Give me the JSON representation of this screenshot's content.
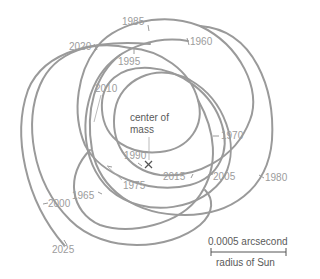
{
  "diagram": {
    "center_label_line1": "center of",
    "center_label_line2": "mass",
    "center_marker": "×",
    "scale": {
      "top_label": "0.0005 arcsecond",
      "bottom_label": "radius of Sun"
    },
    "years": [
      {
        "label": "1960",
        "x": 187,
        "y": 38
      },
      {
        "label": "1965",
        "x": 71,
        "y": 192
      },
      {
        "label": "1970",
        "x": 218,
        "y": 132
      },
      {
        "label": "1975",
        "x": 123,
        "y": 178
      },
      {
        "label": "1980",
        "x": 262,
        "y": 173
      },
      {
        "label": "1985",
        "x": 122,
        "y": 18
      },
      {
        "label": "1990",
        "x": 124,
        "y": 148
      },
      {
        "label": "1995",
        "x": 118,
        "y": 57
      },
      {
        "label": "2000",
        "x": 48,
        "y": 199
      },
      {
        "label": "2005",
        "x": 212,
        "y": 172
      },
      {
        "label": "2010",
        "x": 95,
        "y": 84
      },
      {
        "label": "2015",
        "x": 164,
        "y": 172
      },
      {
        "label": "2020",
        "x": 69,
        "y": 42
      },
      {
        "label": "2025",
        "x": 52,
        "y": 245
      }
    ],
    "colors": {
      "curve": "#9a9a9a",
      "year_text": "#9c9c9c",
      "label_text": "#5a5a5a"
    }
  }
}
